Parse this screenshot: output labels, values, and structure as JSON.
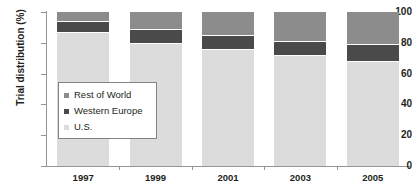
{
  "chart_data": {
    "type": "bar",
    "subtype": "stacked-bar-100",
    "title": "",
    "xlabel": "",
    "ylabel": "Trial distribution (%)",
    "ylim": [
      0,
      100
    ],
    "yticks": [
      0,
      20,
      40,
      60,
      80,
      100
    ],
    "ytick_labels": [
      "0",
      "20",
      "40",
      "60",
      "80",
      "100"
    ],
    "grid": false,
    "legend_position": "inside-left",
    "categories": [
      "1997",
      "1999",
      "2001",
      "2003",
      "2005"
    ],
    "series": [
      {
        "name": "U.S.",
        "color": "#dcdcdc",
        "values": [
          87,
          80,
          76,
          72,
          68
        ]
      },
      {
        "name": "Western Europe",
        "color": "#4a4a4a",
        "values": [
          7,
          9,
          9,
          9,
          11
        ]
      },
      {
        "name": "Rest of World",
        "color": "#8c8c8c",
        "values": [
          6,
          11,
          15,
          19,
          21
        ]
      }
    ],
    "stack_order_bottom_to_top": [
      "U.S.",
      "Western Europe",
      "Rest of World"
    ]
  },
  "axis": {
    "y_title": "Trial distribution (%)",
    "y_ticks": [
      {
        "label": "100",
        "value": 100
      },
      {
        "label": "80",
        "value": 80
      },
      {
        "label": "60",
        "value": 60
      },
      {
        "label": "40",
        "value": 40
      },
      {
        "label": "20",
        "value": 20
      },
      {
        "label": "0",
        "value": 0
      }
    ],
    "x_ticks": [
      {
        "label": "1997"
      },
      {
        "label": "1999"
      },
      {
        "label": "2001"
      },
      {
        "label": "2003"
      },
      {
        "label": "2005"
      }
    ]
  },
  "legend": {
    "items": [
      {
        "label": "Rest of World",
        "color": "#8c8c8c"
      },
      {
        "label": "Western Europe",
        "color": "#4a4a4a"
      },
      {
        "label": "U.S.",
        "color": "#dcdcdc"
      }
    ]
  },
  "colors": {
    "rest_of_world": "#8c8c8c",
    "western_europe": "#4a4a4a",
    "us": "#dcdcdc",
    "axis": "#939598",
    "text": "#231f20",
    "background": "#ffffff"
  }
}
